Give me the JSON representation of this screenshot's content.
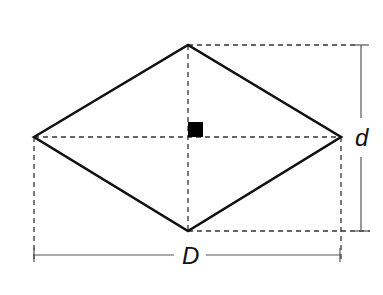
{
  "diagram": {
    "shape": "rhombus",
    "colors": {
      "stroke": "#111111",
      "dashed": "#333333",
      "background": "#ffffff"
    },
    "labels": {
      "long_diagonal": "D",
      "short_diagonal": "d"
    },
    "right_angle_marker": true
  }
}
